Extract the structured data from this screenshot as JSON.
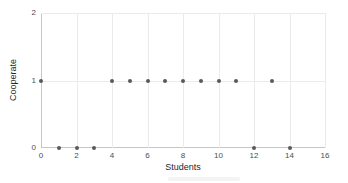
{
  "chart_data": {
    "type": "scatter",
    "title": "",
    "xlabel": "Students",
    "ylabel": "Cooperate",
    "xlim": [
      0,
      16
    ],
    "ylim": [
      0,
      2
    ],
    "x_ticks": [
      0,
      2,
      4,
      6,
      8,
      10,
      12,
      14,
      16
    ],
    "y_ticks": [
      0,
      1,
      2
    ],
    "grid": true,
    "legend": false,
    "series": [
      {
        "name": "cooperate-by-student",
        "points": [
          [
            0,
            1
          ],
          [
            1,
            0
          ],
          [
            2,
            0
          ],
          [
            3,
            0
          ],
          [
            4,
            1
          ],
          [
            5,
            1
          ],
          [
            6,
            1
          ],
          [
            7,
            1
          ],
          [
            8,
            1
          ],
          [
            9,
            1
          ],
          [
            10,
            1
          ],
          [
            11,
            1
          ],
          [
            12,
            0
          ],
          [
            13,
            1
          ],
          [
            14,
            0
          ]
        ]
      }
    ],
    "colors": {
      "point": "#595959",
      "grid": "#ebebeb",
      "axis": "#c6c6c6",
      "tick_label": "#4d4d4d",
      "axis_label": "#262626",
      "background": "#ffffff"
    }
  }
}
